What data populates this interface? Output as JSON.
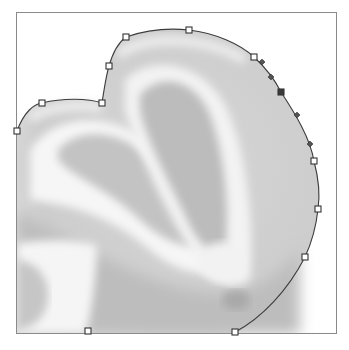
{
  "canvas": {
    "description": "Grayscale photo of a halved citrus fruit with a Bezier selection path drawn around its outline",
    "frame": {
      "x": 16,
      "y": 12,
      "width": 321,
      "height": 322,
      "border_color": "#8a8a8a"
    },
    "colors": {
      "background": "#ffffff",
      "path_stroke": "#3c3c3c",
      "anchor_fill": "#ffffff",
      "anchor_selected_fill": "#3a3a3a",
      "rind_light": "#f4f4f4",
      "flesh_mid": "#c9c9c9",
      "flesh_dark": "#b0b0b0"
    }
  },
  "path": {
    "tool": "pen-path",
    "anchor_points": [
      {
        "id": "a1",
        "x": 17,
        "y": 131,
        "selected": false
      },
      {
        "id": "a2",
        "x": 42,
        "y": 103,
        "selected": false
      },
      {
        "id": "a3",
        "x": 102,
        "y": 103,
        "selected": false
      },
      {
        "id": "a4",
        "x": 109,
        "y": 66,
        "selected": false
      },
      {
        "id": "a5",
        "x": 126,
        "y": 37,
        "selected": false
      },
      {
        "id": "a6",
        "x": 189,
        "y": 30,
        "selected": false
      },
      {
        "id": "a7",
        "x": 254,
        "y": 57,
        "selected": false
      },
      {
        "id": "a8",
        "x": 281,
        "y": 92,
        "selected": true
      },
      {
        "id": "a9",
        "x": 314,
        "y": 161,
        "selected": false
      },
      {
        "id": "a10",
        "x": 318,
        "y": 209,
        "selected": false
      },
      {
        "id": "a11",
        "x": 305,
        "y": 257,
        "selected": false
      },
      {
        "id": "a12",
        "x": 235,
        "y": 332,
        "selected": false
      },
      {
        "id": "a13",
        "x": 88,
        "y": 331,
        "selected": false
      }
    ],
    "direction_handles": [
      {
        "id": "h1",
        "x": 262,
        "y": 62
      },
      {
        "id": "h2",
        "x": 271,
        "y": 77
      },
      {
        "id": "h3",
        "x": 297,
        "y": 115
      },
      {
        "id": "h4",
        "x": 310,
        "y": 144
      }
    ]
  }
}
